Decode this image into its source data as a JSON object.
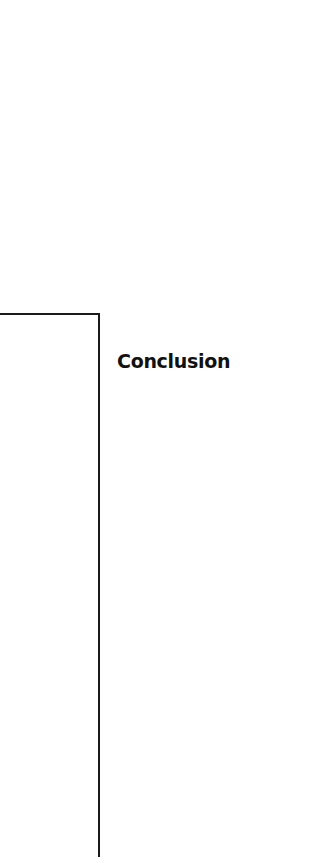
{
  "section": {
    "heading": "Conclusion"
  }
}
